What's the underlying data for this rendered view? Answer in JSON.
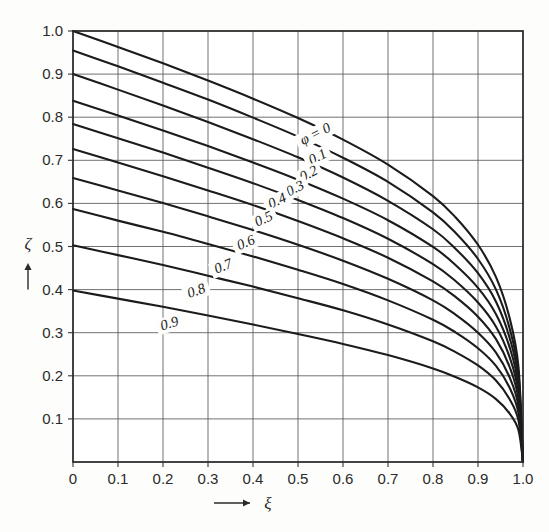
{
  "figure": {
    "background_color": "#fdfdfb",
    "curve_color": "#1b1b1b",
    "grid_color": "#55585a",
    "frame_color": "#232323"
  },
  "chart_data": {
    "type": "line",
    "title": "",
    "subtitle": "",
    "xlabel": "ξ",
    "ylabel": "ζ",
    "xlabel_arrow": "⟶",
    "ylabel_arrow": "↑",
    "xlim": [
      0,
      1
    ],
    "ylim": [
      0,
      1
    ],
    "grid": true,
    "legend_position": "inline-on-curves",
    "xticks": [
      0,
      0.1,
      0.2,
      0.3,
      0.4,
      0.5,
      0.6,
      0.7,
      0.8,
      0.9,
      1.0
    ],
    "xticklabels": [
      "0",
      "0.1",
      "0.2",
      "0.3",
      "0.4",
      "0.5",
      "0.6",
      "0.7",
      "0.8",
      "0.9",
      "1.0"
    ],
    "yticks": [
      0.1,
      0.2,
      0.3,
      0.4,
      0.5,
      0.6,
      0.7,
      0.8,
      0.9,
      1.0
    ],
    "yticklabels": [
      "0.1",
      "0.2",
      "0.3",
      "0.4",
      "0.5",
      "0.6",
      "0.7",
      "0.8",
      "0.9",
      "1.0"
    ],
    "parameter_symbol": "φ",
    "first_label_text": "φ = 0",
    "series": [
      {
        "name": "φ = 0",
        "label": "φ = 0",
        "phi": 0,
        "x": [
          0,
          0.1,
          0.2,
          0.3,
          0.4,
          0.5,
          0.6,
          0.7,
          0.8,
          0.85,
          0.9,
          0.94,
          0.97,
          0.99,
          1.0
        ],
        "y": [
          1.0,
          0.963,
          0.925,
          0.885,
          0.843,
          0.798,
          0.748,
          0.69,
          0.617,
          0.568,
          0.504,
          0.429,
          0.335,
          0.22,
          0.0
        ]
      },
      {
        "name": "φ = 0.1",
        "label": "0.1",
        "phi": 0.1,
        "x": [
          0,
          0.1,
          0.2,
          0.3,
          0.4,
          0.5,
          0.6,
          0.7,
          0.8,
          0.85,
          0.9,
          0.94,
          0.97,
          0.99,
          1.0
        ],
        "y": [
          0.955,
          0.918,
          0.88,
          0.841,
          0.799,
          0.755,
          0.706,
          0.65,
          0.579,
          0.532,
          0.471,
          0.4,
          0.311,
          0.204,
          0.0
        ]
      },
      {
        "name": "φ = 0.2",
        "label": "0.2",
        "phi": 0.2,
        "x": [
          0,
          0.1,
          0.2,
          0.3,
          0.4,
          0.5,
          0.6,
          0.7,
          0.8,
          0.85,
          0.9,
          0.94,
          0.97,
          0.99,
          1.0
        ],
        "y": [
          0.9,
          0.864,
          0.827,
          0.789,
          0.749,
          0.707,
          0.66,
          0.606,
          0.54,
          0.495,
          0.438,
          0.372,
          0.289,
          0.19,
          0.0
        ]
      },
      {
        "name": "φ = 0.3",
        "label": "0.3",
        "phi": 0.3,
        "x": [
          0,
          0.1,
          0.2,
          0.3,
          0.4,
          0.5,
          0.6,
          0.7,
          0.8,
          0.85,
          0.9,
          0.94,
          0.97,
          0.99,
          1.0
        ],
        "y": [
          0.838,
          0.804,
          0.769,
          0.733,
          0.695,
          0.655,
          0.611,
          0.561,
          0.499,
          0.457,
          0.404,
          0.343,
          0.267,
          0.175,
          0.0
        ]
      },
      {
        "name": "φ = 0.4",
        "label": "0.4",
        "phi": 0.4,
        "x": [
          0,
          0.1,
          0.2,
          0.3,
          0.4,
          0.5,
          0.6,
          0.7,
          0.8,
          0.85,
          0.9,
          0.94,
          0.97,
          0.99,
          1.0
        ],
        "y": [
          0.784,
          0.751,
          0.718,
          0.683,
          0.647,
          0.608,
          0.566,
          0.518,
          0.459,
          0.42,
          0.37,
          0.314,
          0.244,
          0.16,
          0.0
        ]
      },
      {
        "name": "φ = 0.5",
        "label": "0.5",
        "phi": 0.5,
        "x": [
          0,
          0.1,
          0.2,
          0.3,
          0.4,
          0.5,
          0.6,
          0.7,
          0.8,
          0.85,
          0.9,
          0.94,
          0.97,
          0.99,
          1.0
        ],
        "y": [
          0.726,
          0.695,
          0.663,
          0.63,
          0.596,
          0.559,
          0.519,
          0.474,
          0.419,
          0.383,
          0.337,
          0.285,
          0.221,
          0.145,
          0.0
        ]
      },
      {
        "name": "φ = 0.6",
        "label": "0.6",
        "phi": 0.6,
        "x": [
          0,
          0.1,
          0.2,
          0.3,
          0.4,
          0.5,
          0.6,
          0.7,
          0.8,
          0.85,
          0.9,
          0.94,
          0.97,
          0.99,
          1.0
        ],
        "y": [
          0.659,
          0.63,
          0.601,
          0.57,
          0.538,
          0.504,
          0.467,
          0.425,
          0.375,
          0.342,
          0.3,
          0.254,
          0.197,
          0.129,
          0.0
        ]
      },
      {
        "name": "φ = 0.7",
        "label": "0.7",
        "phi": 0.7,
        "x": [
          0,
          0.1,
          0.2,
          0.3,
          0.4,
          0.5,
          0.6,
          0.7,
          0.8,
          0.85,
          0.9,
          0.94,
          0.97,
          0.99,
          1.0
        ],
        "y": [
          0.587,
          0.56,
          0.534,
          0.506,
          0.477,
          0.446,
          0.413,
          0.375,
          0.33,
          0.301,
          0.264,
          0.223,
          0.173,
          0.113,
          0.0
        ]
      },
      {
        "name": "φ = 0.8",
        "label": "0.8",
        "phi": 0.8,
        "x": [
          0,
          0.1,
          0.2,
          0.3,
          0.4,
          0.5,
          0.6,
          0.7,
          0.8,
          0.85,
          0.9,
          0.94,
          0.97,
          0.99,
          1.0
        ],
        "y": [
          0.503,
          0.48,
          0.457,
          0.432,
          0.407,
          0.38,
          0.352,
          0.319,
          0.28,
          0.255,
          0.224,
          0.189,
          0.146,
          0.096,
          0.0
        ]
      },
      {
        "name": "φ = 0.9",
        "label": "0.9",
        "phi": 0.9,
        "x": [
          0,
          0.1,
          0.2,
          0.3,
          0.4,
          0.5,
          0.6,
          0.7,
          0.8,
          0.85,
          0.9,
          0.94,
          0.97,
          0.99,
          1.0
        ],
        "y": [
          0.398,
          0.379,
          0.36,
          0.34,
          0.319,
          0.297,
          0.274,
          0.248,
          0.217,
          0.197,
          0.173,
          0.146,
          0.113,
          0.074,
          0.0
        ]
      }
    ],
    "curve_labels": [
      {
        "text": "φ = 0",
        "x": 0.54,
        "y": 0.758,
        "rotate": -27
      },
      {
        "text": "0.1",
        "x": 0.545,
        "y": 0.705,
        "rotate": -27
      },
      {
        "text": "0.2",
        "x": 0.525,
        "y": 0.666,
        "rotate": -27
      },
      {
        "text": "0.3",
        "x": 0.495,
        "y": 0.632,
        "rotate": -27
      },
      {
        "text": "0.4",
        "x": 0.455,
        "y": 0.603,
        "rotate": -25
      },
      {
        "text": "0.5",
        "x": 0.425,
        "y": 0.561,
        "rotate": -25
      },
      {
        "text": "0.6",
        "x": 0.385,
        "y": 0.506,
        "rotate": -23
      },
      {
        "text": "0.7",
        "x": 0.335,
        "y": 0.451,
        "rotate": -22
      },
      {
        "text": "0.8",
        "x": 0.275,
        "y": 0.394,
        "rotate": -20
      },
      {
        "text": "0.9",
        "x": 0.215,
        "y": 0.318,
        "rotate": -17
      }
    ]
  }
}
